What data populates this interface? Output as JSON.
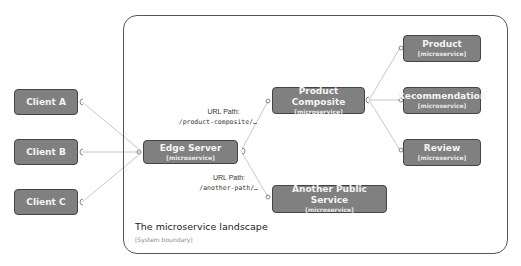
{
  "boundary": {
    "title": "The microservice landscape",
    "subtitle": "[System boundary]"
  },
  "nodes": {
    "client_a": {
      "title": "Client A"
    },
    "client_b": {
      "title": "Client B"
    },
    "client_c": {
      "title": "Client C"
    },
    "edge_server": {
      "title": "Edge Server",
      "subtitle": "[microservice]"
    },
    "product_composite": {
      "title": "Product Composite",
      "subtitle": "[microservice]"
    },
    "another_public_service": {
      "title": "Another Public Service",
      "subtitle": "[microservice]"
    },
    "product": {
      "title": "Product",
      "subtitle": "[microservice]"
    },
    "recommendation": {
      "title": "Recommendation",
      "subtitle": "[microservice]"
    },
    "review": {
      "title": "Review",
      "subtitle": "[microservice]"
    }
  },
  "edges": {
    "to_product_composite": {
      "label": "URL Path:",
      "path": "/product-composite/…"
    },
    "to_another_service": {
      "label": "URL Path:",
      "path": "/another-path/…"
    }
  },
  "colors": {
    "node_fill": "#808080",
    "node_border": "#444444",
    "connector": "#c8c8c8",
    "boundary": "#555555"
  }
}
